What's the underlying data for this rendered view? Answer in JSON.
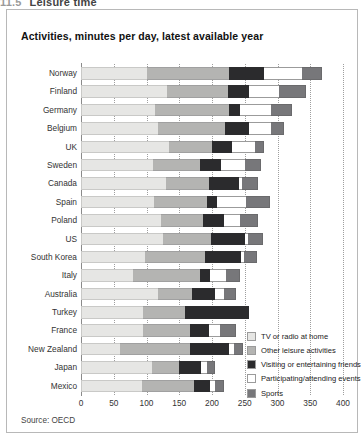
{
  "crop_header": {
    "number": "11.5",
    "text": "Leisure time"
  },
  "chart_title": "Activities, minutes per day, latest available year",
  "source": "Source: OECD",
  "legend": {
    "position": "inside-bottom-right",
    "items": [
      {
        "label": "TV or radio at home",
        "color": "#e6e6e4"
      },
      {
        "label": "Other leisure activities",
        "color": "#b4b4b2"
      },
      {
        "label": "Visiting or entertaining friends",
        "color": "#2b2b2d"
      },
      {
        "label": "Participating/attending events",
        "color": "#ffffff"
      },
      {
        "label": "Sports",
        "color": "#77777a"
      }
    ]
  },
  "chart_data": {
    "type": "bar",
    "orientation": "horizontal",
    "stacked": true,
    "title": "Activities, minutes per day, latest available year",
    "xlabel": "",
    "ylabel": "",
    "xlim": [
      0,
      400
    ],
    "xticks": [
      0,
      50,
      100,
      150,
      200,
      250,
      300,
      350,
      400
    ],
    "grid": true,
    "categories": [
      "Norway",
      "Finland",
      "Germany",
      "Belgium",
      "UK",
      "Sweden",
      "Canada",
      "Spain",
      "Poland",
      "US",
      "South Korea",
      "Italy",
      "Australia",
      "Turkey",
      "France",
      "New Zealand",
      "Japan",
      "Mexico"
    ],
    "series": [
      {
        "name": "TV or radio at home",
        "color": "#e6e6e4",
        "values": [
          101,
          131,
          113,
          118,
          135,
          110,
          130,
          111,
          122,
          125,
          97,
          80,
          117,
          95,
          95,
          60,
          108,
          93
        ]
      },
      {
        "name": "Other leisure activities",
        "color": "#b4b4b2",
        "values": [
          125,
          93,
          113,
          102,
          65,
          72,
          66,
          81,
          65,
          73,
          93,
          101,
          52,
          64,
          71,
          107,
          42,
          80
        ]
      },
      {
        "name": "Visiting or entertaining friends",
        "color": "#2b2b2d",
        "values": [
          54,
          33,
          17,
          37,
          31,
          32,
          45,
          15,
          32,
          52,
          55,
          16,
          35,
          97,
          29,
          59,
          33,
          24
        ]
      },
      {
        "name": "Participating/attending events",
        "color": "#ffffff",
        "values": [
          57,
          45,
          47,
          33,
          34,
          36,
          5,
          45,
          24,
          5,
          4,
          25,
          14,
          0,
          18,
          7,
          10,
          8
        ]
      },
      {
        "name": "Sports",
        "color": "#77777a",
        "values": [
          31,
          42,
          32,
          20,
          14,
          25,
          24,
          36,
          28,
          23,
          20,
          21,
          18,
          0,
          23,
          15,
          12,
          13
        ]
      }
    ],
    "totals": [
      368,
      344,
      322,
      310,
      279,
      275,
      270,
      288,
      271,
      278,
      269,
      243,
      236,
      256,
      236,
      248,
      205,
      218
    ]
  }
}
